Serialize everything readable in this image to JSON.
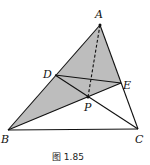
{
  "figure": {
    "caption": "图 1.85",
    "points": {
      "A": {
        "label": "A",
        "x": 100,
        "y": 25
      },
      "B": {
        "label": "B",
        "x": 8,
        "y": 130
      },
      "C": {
        "label": "C",
        "x": 138,
        "y": 129
      },
      "D": {
        "label": "D",
        "x": 55,
        "y": 75
      },
      "E": {
        "label": "E",
        "x": 121,
        "y": 83
      },
      "P": {
        "label": "P",
        "x": 88,
        "y": 97
      }
    },
    "segments_solid": [
      "AB",
      "AC",
      "BC",
      "DE",
      "BE",
      "DC"
    ],
    "segments_dashed": [
      "AP"
    ],
    "shaded_region": [
      "A",
      "B",
      "P",
      "E"
    ],
    "shade_color": "#bdbdbd",
    "line_color": "#111111"
  }
}
